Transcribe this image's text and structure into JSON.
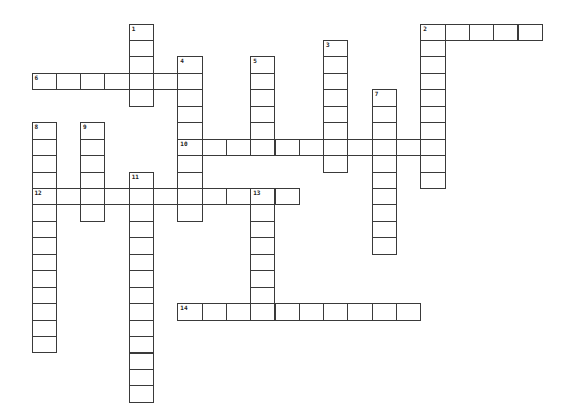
{
  "puzzle": {
    "grid": {
      "origin_x": 32,
      "origin_y": 24,
      "cell_w": 24.3,
      "cell_h": 16.45,
      "border_color": "#3a3a3a",
      "background": "#ffffff"
    },
    "entries": [
      {
        "number": "1",
        "direction": "down",
        "col": 4,
        "row": 0,
        "length": 5
      },
      {
        "number": "2",
        "direction": "across",
        "col": 16,
        "row": 0,
        "length": 5
      },
      {
        "number": "2",
        "direction": "down",
        "col": 16,
        "row": 0,
        "length": 10
      },
      {
        "number": "3",
        "direction": "down",
        "col": 12,
        "row": 1,
        "length": 8
      },
      {
        "number": "4",
        "direction": "down",
        "col": 6,
        "row": 2,
        "length": 10
      },
      {
        "number": "5",
        "direction": "down",
        "col": 9,
        "row": 2,
        "length": 6
      },
      {
        "number": "6",
        "direction": "across",
        "col": 0,
        "row": 3,
        "length": 7
      },
      {
        "number": "7",
        "direction": "down",
        "col": 14,
        "row": 4,
        "length": 10
      },
      {
        "number": "8",
        "direction": "down",
        "col": 0,
        "row": 6,
        "length": 14
      },
      {
        "number": "9",
        "direction": "down",
        "col": 2,
        "row": 6,
        "length": 6
      },
      {
        "number": "10",
        "direction": "across",
        "col": 6,
        "row": 7,
        "length": 11
      },
      {
        "number": "11",
        "direction": "down",
        "col": 4,
        "row": 9,
        "length": 14
      },
      {
        "number": "12",
        "direction": "across",
        "col": 0,
        "row": 10,
        "length": 11
      },
      {
        "number": "13",
        "direction": "down",
        "col": 9,
        "row": 10,
        "length": 8
      },
      {
        "number": "14",
        "direction": "across",
        "col": 6,
        "row": 17,
        "length": 10
      }
    ]
  }
}
